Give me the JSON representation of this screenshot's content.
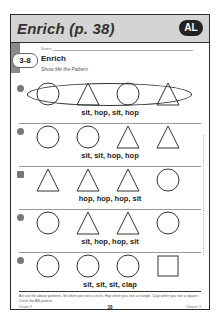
{
  "header": {
    "title": "Enrich (p. 38)",
    "level_badge": "AL"
  },
  "worksheet": {
    "lesson_number": "3-8",
    "name_label": "Name",
    "title": "Enrich",
    "subtitle": "Show Me the Pattern"
  },
  "rows": [
    {
      "icon": "number-1-icon",
      "shapes": [
        "circle",
        "triangle",
        "circle",
        "triangle"
      ],
      "caption": "sit, hop, sit, hop",
      "circled": true
    },
    {
      "icon": "number-2-icon",
      "shapes": [
        "circle",
        "circle",
        "triangle",
        "triangle"
      ],
      "caption": "sit, sit, hop, hop",
      "circled": false
    },
    {
      "icon": "number-3-icon",
      "shapes": [
        "triangle",
        "triangle",
        "triangle",
        "circle"
      ],
      "caption": "hop, hop, hop, sit",
      "circled": false
    },
    {
      "icon": "fish-icon",
      "shapes": [
        "circle",
        "triangle",
        "triangle",
        "circle"
      ],
      "caption": "sit, hop, hop, sit",
      "circled": false
    },
    {
      "icon": "number-5-icon",
      "shapes": [
        "circle",
        "circle",
        "circle",
        "square"
      ],
      "caption": "sit, sit, sit, clap",
      "circled": false
    }
  ],
  "instructions": "Act out the above patterns. Sit when you see a circle. Hop when you see a triangle. Clap when you see a square. Circle the AB pattern.",
  "footer": {
    "left": "Grade K",
    "page": "38",
    "right": "Chapter 3"
  }
}
